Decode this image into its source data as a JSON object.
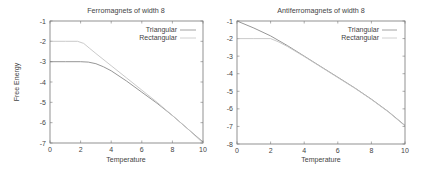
{
  "chart_data": [
    {
      "type": "line",
      "title": "Ferromagnets of width 8",
      "xlabel": "Temperature",
      "ylabel": "Free Energy",
      "xlim": [
        0,
        10
      ],
      "ylim": [
        -7,
        -1
      ],
      "xticks": [
        "0",
        "2",
        "4",
        "6",
        "8",
        "10"
      ],
      "yticks": [
        "-1",
        "-2",
        "-3",
        "-4",
        "-5",
        "-6",
        "-7"
      ],
      "grid": false,
      "legend_position": "top-right",
      "series": [
        {
          "name": "Triangular",
          "x": [
            0,
            1,
            2,
            2.5,
            3,
            3.5,
            4,
            5,
            6,
            7,
            8,
            9,
            10
          ],
          "y": [
            -3,
            -3,
            -3,
            -3.02,
            -3.1,
            -3.25,
            -3.45,
            -3.95,
            -4.5,
            -5.05,
            -5.65,
            -6.3,
            -6.95
          ]
        },
        {
          "name": "Rectangular",
          "x": [
            0,
            1,
            1.8,
            2.2,
            2.6,
            3,
            4,
            5,
            6,
            7,
            8,
            9,
            10
          ],
          "y": [
            -2,
            -2,
            -2,
            -2.1,
            -2.35,
            -2.6,
            -3.2,
            -3.8,
            -4.4,
            -5.0,
            -5.65,
            -6.3,
            -7.0
          ]
        }
      ]
    },
    {
      "type": "line",
      "title": "Antiferromagnets of width 8",
      "xlabel": "Temperature",
      "ylabel": "",
      "xlim": [
        0,
        10
      ],
      "ylim": [
        -8,
        -1
      ],
      "xticks": [
        "0",
        "2",
        "4",
        "6",
        "8",
        "10"
      ],
      "yticks": [
        "-1",
        "-2",
        "-3",
        "-4",
        "-5",
        "-6",
        "-7",
        "-8"
      ],
      "grid": false,
      "legend_position": "top-right",
      "series": [
        {
          "name": "Triangular",
          "x": [
            0,
            1,
            2,
            3,
            4,
            5,
            6,
            7,
            8,
            9,
            10
          ],
          "y": [
            -1,
            -1.4,
            -1.85,
            -2.4,
            -3.0,
            -3.6,
            -4.2,
            -4.8,
            -5.45,
            -6.15,
            -6.95
          ]
        },
        {
          "name": "Rectangular",
          "x": [
            0,
            1,
            2,
            2.5,
            3,
            4,
            5,
            6,
            7,
            8,
            9,
            10
          ],
          "y": [
            -2,
            -2,
            -2,
            -2.2,
            -2.45,
            -3.02,
            -3.62,
            -4.22,
            -4.82,
            -5.47,
            -6.17,
            -6.97
          ]
        }
      ]
    }
  ],
  "charts": {
    "left": {
      "title": "Ferromagnets of width 8",
      "xlabel": "Temperature",
      "ylabel": "Free Energy",
      "legend": [
        "Triangular",
        "Rectangular"
      ]
    },
    "right": {
      "title": "Antiferromagnets of width 8",
      "xlabel": "Temperature",
      "legend": [
        "Triangular",
        "Rectangular"
      ]
    }
  },
  "colors": {
    "axis": "#777777",
    "triangular": "#8a8a8a",
    "rectangular": "#c4c4c4",
    "text": "#444444"
  }
}
